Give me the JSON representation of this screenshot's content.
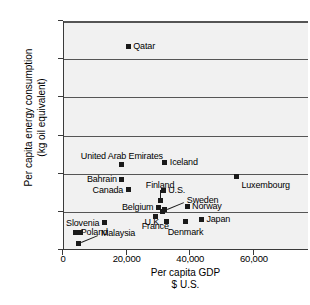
{
  "chart_data": {
    "type": "scatter",
    "title": "",
    "xlabel": "Per capita GDP\n$ U.S.",
    "ylabel": "Per capita energy consumption\n(kg oil equivalent)",
    "xlim": [
      0,
      77000
    ],
    "ylim": [
      0,
      30000
    ],
    "grid": "horizontal",
    "legend": "none",
    "xticks": [
      {
        "value": 0,
        "label": "0"
      },
      {
        "value": 20000,
        "label": "20,000"
      },
      {
        "value": 40000,
        "label": "40,000"
      },
      {
        "value": 60000,
        "label": "60,000"
      }
    ],
    "yticks": [
      {
        "value": 0,
        "label": "0"
      },
      {
        "value": 5000,
        "label": "5,000"
      },
      {
        "value": 10000,
        "label": "10,000"
      },
      {
        "value": 15000,
        "label": "15,000"
      },
      {
        "value": 20000,
        "label": "20,000"
      },
      {
        "value": 25000,
        "label": "25,000"
      },
      {
        "value": 30000,
        "label": "30,000"
      }
    ],
    "points": [
      {
        "name": "Qatar",
        "x": 20500,
        "y": 26700,
        "label_pos": "l"
      },
      {
        "name": "Iceland",
        "x": 32000,
        "y": 11500,
        "label_pos": "l"
      },
      {
        "name": "United Arab Emirates",
        "x": 18500,
        "y": 11200,
        "label_pos": "above"
      },
      {
        "name": "Luxembourg",
        "x": 54500,
        "y": 9600,
        "label_pos": "below-right"
      },
      {
        "name": "Bahrain",
        "x": 18500,
        "y": 9300,
        "label_pos": "r"
      },
      {
        "name": "Canada",
        "x": 20500,
        "y": 7900,
        "label_pos": "r"
      },
      {
        "name": "U.S.",
        "x": 31500,
        "y": 7800,
        "label_pos": "l"
      },
      {
        "name": "Finland",
        "x": 30500,
        "y": 6500,
        "label_pos": "leader-up"
      },
      {
        "name": "Sweden",
        "x": 32000,
        "y": 5300,
        "label_pos": "leader-right"
      },
      {
        "name": "Belgium",
        "x": 30000,
        "y": 5600,
        "label_pos": "r"
      },
      {
        "name": "Norway",
        "x": 39000,
        "y": 5700,
        "label_pos": "l"
      },
      {
        "name": "France",
        "x": 29000,
        "y": 4400,
        "label_pos": "below"
      },
      {
        "name": "Japan",
        "x": 43500,
        "y": 4000,
        "label_pos": "l"
      },
      {
        "name": "U.K.",
        "x": 32500,
        "y": 3700,
        "label_pos": "r"
      },
      {
        "name": "Denmark",
        "x": 38500,
        "y": 3700,
        "label_pos": "below"
      },
      {
        "name": "Slovenia",
        "x": 13000,
        "y": 3600,
        "label_pos": "r"
      },
      {
        "name": "Poland",
        "x": 4000,
        "y": 2300,
        "label_pos": "l"
      },
      {
        "name": "Malaysia",
        "x": 5000,
        "y": 900,
        "label_pos": "leader-right"
      }
    ],
    "extra_markers": [
      {
        "note": "second marker adjacent to Poland",
        "x": 5600,
        "y": 2300
      },
      {
        "note": "marker below Belgium cluster",
        "x": 31200,
        "y": 5100
      }
    ]
  }
}
